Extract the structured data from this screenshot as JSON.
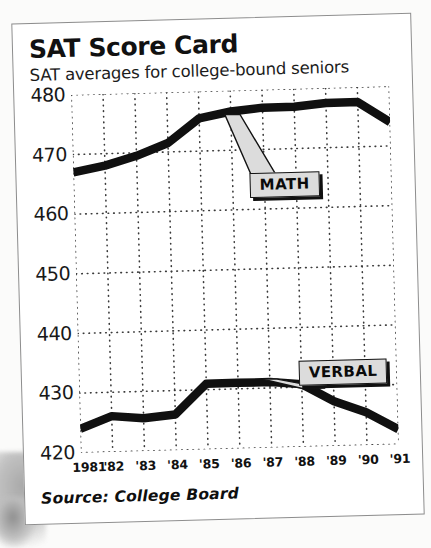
{
  "header": {
    "title": "SAT Score Card",
    "subtitle": "SAT averages for college-bound seniors"
  },
  "footer": {
    "source": "Source:  College Board"
  },
  "labels": {
    "math": "MATH",
    "verbal": "VERBAL"
  },
  "colors": {
    "line": "#101010",
    "grid": "#3a3a3a",
    "callout_fill": "#dcdcdc",
    "callout_border": "#141414",
    "paper": "#ffffff",
    "frame": "#8d8d8d"
  },
  "chart_data": {
    "type": "line",
    "title": "SAT Score Card",
    "subtitle": "SAT averages for college-bound seniors",
    "source": "Source:  College Board",
    "xlabel": "",
    "ylabel": "",
    "x": [
      1981,
      1982,
      1983,
      1984,
      1985,
      1986,
      1987,
      1988,
      1989,
      1990,
      1991
    ],
    "categories": [
      "1981",
      "'82",
      "'83",
      "'84",
      "'85",
      "'86",
      "'87",
      "'88",
      "'89",
      "'90",
      "'91"
    ],
    "ylim": [
      420,
      480
    ],
    "yticks": [
      420,
      430,
      440,
      450,
      460,
      470,
      480
    ],
    "ytick_labels": [
      "420",
      "430",
      "440",
      "450",
      "460",
      "470",
      "480"
    ],
    "grid": true,
    "grid_style": "dotted",
    "legend": "inline-callouts",
    "series": [
      {
        "name": "MATH",
        "values": [
          467,
          468,
          469.5,
          471.5,
          475.5,
          476.5,
          477,
          477,
          477.5,
          477.5,
          474
        ]
      },
      {
        "name": "VERBAL",
        "values": [
          424,
          426,
          425.5,
          426,
          431,
          431,
          431,
          430.5,
          427.5,
          425.5,
          422.5
        ]
      }
    ],
    "annotations": [
      {
        "text": "MATH",
        "points_to_year": 1986
      },
      {
        "text": "VERBAL",
        "points_to_year": 1987
      }
    ]
  }
}
